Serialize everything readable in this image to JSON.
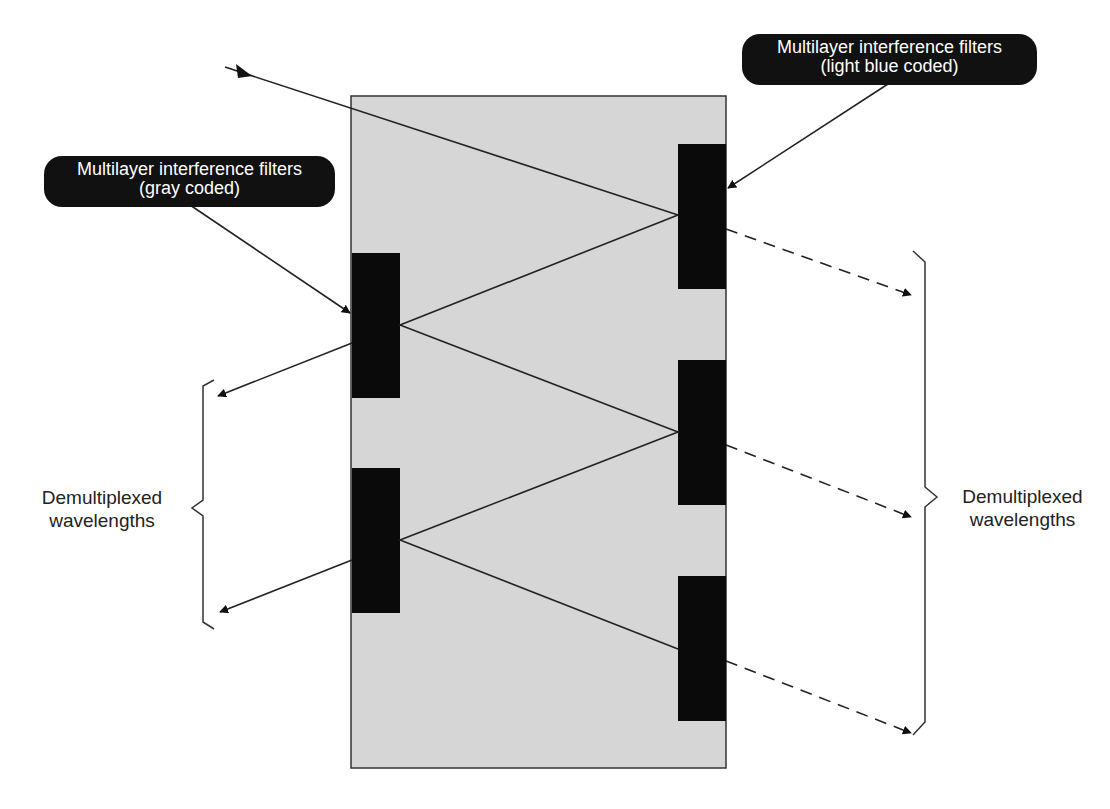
{
  "labels": {
    "top_right_pill": {
      "line1": "Multilayer interference filters",
      "line2": "(light blue coded)"
    },
    "left_pill": {
      "line1": "Multilayer interference filters",
      "line2": "(gray coded)"
    },
    "left_output": {
      "line1": "Demultiplexed",
      "line2": "wavelengths"
    },
    "right_output": {
      "line1": "Demultiplexed",
      "line2": "wavelengths"
    }
  },
  "colors": {
    "substrate": "#d6d6d6",
    "filter": "#0a0a0a",
    "line": "#222222",
    "pill_bg": "#111111",
    "pill_text": "#ffffff"
  }
}
